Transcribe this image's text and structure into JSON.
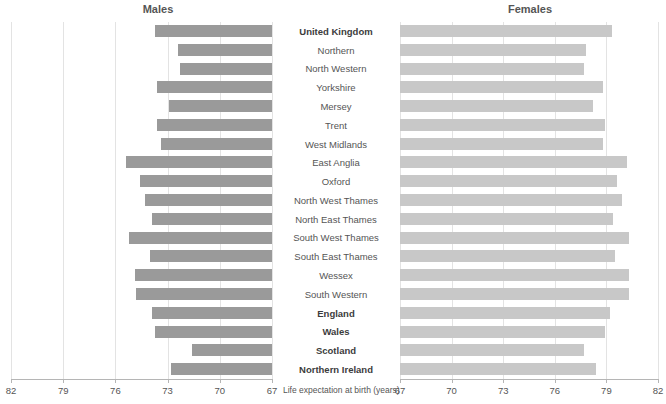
{
  "panels": {
    "left_title": "Males",
    "right_title": "Females"
  },
  "axis": {
    "caption": "Life expectation at birth (years)",
    "left_ticks": [
      "82",
      "79",
      "76",
      "73",
      "70",
      "67"
    ],
    "right_ticks": [
      "67",
      "70",
      "73",
      "76",
      "79",
      "82"
    ],
    "left_range": [
      82,
      67
    ],
    "right_range": [
      67,
      82
    ],
    "tick_step": 3
  },
  "colors": {
    "male_bar": "#9a9a9a",
    "female_bar": "#c8c8c8",
    "gridline": "#e3e3e3",
    "axis": "#b5b5b5",
    "text": "#555555"
  },
  "chart_data": {
    "type": "bar",
    "title": "",
    "subtitle": "",
    "xlabel": "Life expectation at birth (years)",
    "ylabel": "",
    "orientation": "horizontal",
    "layout": "back-to-back population pyramid (mirrored bars, labels centered)",
    "grid": true,
    "legend": "none",
    "xlim_left": [
      82,
      67
    ],
    "xlim_right": [
      67,
      82
    ],
    "categories": [
      "United Kingdom",
      "Northern",
      "North Western",
      "Yorkshire",
      "Mersey",
      "Trent",
      "West Midlands",
      "East Anglia",
      "Oxford",
      "North West Thames",
      "North East Thames",
      "South West Thames",
      "South East Thames",
      "Wessex",
      "South Western",
      "England",
      "Wales",
      "Scotland",
      "Northern Ireland"
    ],
    "bold_categories": [
      "United Kingdom",
      "England",
      "Wales",
      "Scotland",
      "Northern Ireland"
    ],
    "series": [
      {
        "name": "Males",
        "side": "left",
        "values": [
          73.7,
          72.4,
          72.3,
          73.6,
          72.9,
          73.6,
          73.4,
          75.4,
          74.6,
          74.3,
          73.9,
          75.2,
          74.0,
          74.9,
          74.8,
          73.9,
          73.7,
          71.6,
          72.8
        ]
      },
      {
        "name": "Females",
        "side": "right",
        "values": [
          79.3,
          77.8,
          77.7,
          78.8,
          78.2,
          78.9,
          78.8,
          80.2,
          79.6,
          79.9,
          79.4,
          80.3,
          79.5,
          80.3,
          80.3,
          79.2,
          78.9,
          77.7,
          78.4
        ]
      }
    ]
  }
}
